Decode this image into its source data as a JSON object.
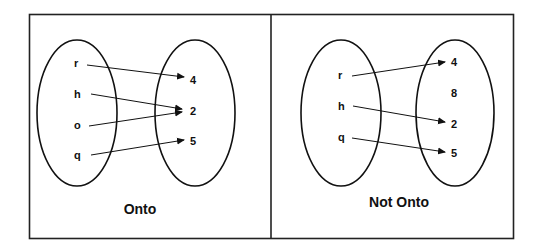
{
  "panels": [
    {
      "caption": "Onto",
      "domain": [
        "r",
        "h",
        "o",
        "q"
      ],
      "codomain": [
        "4",
        "2",
        "5"
      ],
      "mappings": [
        [
          "r",
          "4"
        ],
        [
          "h",
          "2"
        ],
        [
          "o",
          "2"
        ],
        [
          "q",
          "5"
        ]
      ]
    },
    {
      "caption": "Not Onto",
      "domain": [
        "r",
        "h",
        "q"
      ],
      "codomain": [
        "4",
        "8",
        "2",
        "5"
      ],
      "mappings": [
        [
          "r",
          "4"
        ],
        [
          "h",
          "2"
        ],
        [
          "q",
          "5"
        ]
      ]
    }
  ],
  "colors": {
    "stroke": "#111111",
    "background": "#ffffff"
  }
}
